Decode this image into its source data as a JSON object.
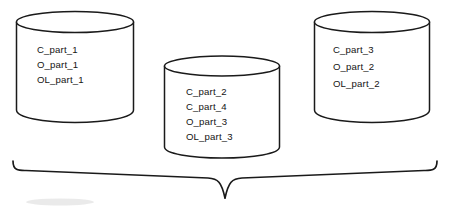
{
  "diagram": {
    "type": "database-partition-diagram",
    "background_color": "#ffffff",
    "stroke_color": "#1a1a1a",
    "text_color": "#141414",
    "databases": [
      {
        "id": "db-left",
        "name": "database-cylinder-left",
        "position": {
          "x": 16,
          "y": 11,
          "width": 118,
          "height": 111
        },
        "text_origin": {
          "x": 37,
          "y": 53
        },
        "line_height": 15,
        "items": [
          "C_part_1",
          "O_part_1",
          "OL_part_1"
        ]
      },
      {
        "id": "db-center",
        "name": "database-cylinder-center",
        "position": {
          "x": 164,
          "y": 56,
          "width": 116,
          "height": 102
        },
        "text_origin": {
          "x": 186,
          "y": 95
        },
        "line_height": 15,
        "items": [
          "C_part_2",
          "C_part_4",
          "O_part_3",
          "OL_part_3"
        ]
      },
      {
        "id": "db-right",
        "name": "database-cylinder-right",
        "position": {
          "x": 314,
          "y": 11,
          "width": 116,
          "height": 111
        },
        "text_origin": {
          "x": 333,
          "y": 53
        },
        "line_height": 17,
        "items": [
          "C_part_3",
          "O_part_2",
          "OL_part_2"
        ]
      }
    ],
    "brace": {
      "name": "grouping-brace",
      "left_x": 13,
      "right_x": 437,
      "top_y": 161,
      "center_x": 225,
      "point_y": 198,
      "label": ""
    }
  }
}
